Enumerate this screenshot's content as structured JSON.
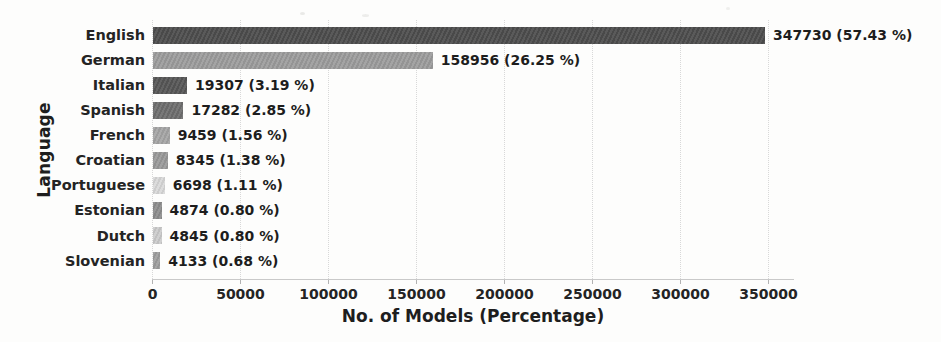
{
  "figure": {
    "background": "#fdfdfc",
    "text_color": "#242424",
    "axis_color": "#c9c9c9",
    "grid_color": "#d8d8d8"
  },
  "chart_data": {
    "type": "bar",
    "orientation": "horizontal",
    "title": "",
    "xlabel": "No. of Models (Percentage)",
    "ylabel": "Language",
    "categories": [
      "English",
      "German",
      "Italian",
      "Spanish",
      "French",
      "Croatian",
      "Portuguese",
      "Estonian",
      "Dutch",
      "Slovenian"
    ],
    "values": [
      347730,
      158956,
      19307,
      17282,
      9459,
      8345,
      6698,
      4874,
      4845,
      4133
    ],
    "percentages": [
      57.43,
      26.25,
      3.19,
      2.85,
      1.56,
      1.38,
      1.11,
      0.8,
      0.8,
      0.68
    ],
    "value_labels": [
      "347730 (57.43 %)",
      "158956 (26.25 %)",
      "19307 (3.19 %)",
      "17282 (2.85 %)",
      "9459 (1.56 %)",
      "8345 (1.38 %)",
      "6698 (1.11 %)",
      "4874 (0.80 %)",
      "4845 (0.80 %)",
      "4133 (0.68 %)"
    ],
    "bar_colors": [
      "#4e4e4e",
      "#9d9d9d",
      "#575757",
      "#6f6f6f",
      "#a6a6a6",
      "#9a9a9a",
      "#d9d9d9",
      "#8e8e8e",
      "#cccccc",
      "#9e9e9e"
    ],
    "x_ticks": [
      0,
      50000,
      100000,
      150000,
      200000,
      250000,
      300000,
      350000
    ],
    "x_tick_labels": [
      "0",
      "50000",
      "100000",
      "150000",
      "200000",
      "250000",
      "300000",
      "350000"
    ],
    "xlim": [
      0,
      364000
    ],
    "grid": {
      "axis": "x",
      "style": "dotted",
      "position": "behind-bars"
    },
    "legend": "none"
  }
}
